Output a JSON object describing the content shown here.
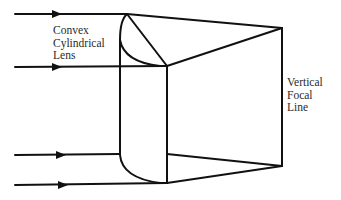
{
  "diagram": {
    "labels": {
      "lens": "Convex\nCylindrical\nLens",
      "focal_line": "Vertical\nFocal\nLine"
    },
    "colors": {
      "stroke": "#111111",
      "text": "#2a2a2a",
      "background": "#ffffff"
    },
    "incident_rays": [
      {
        "id": "ray-1",
        "y": 14
      },
      {
        "id": "ray-2",
        "y": 67
      },
      {
        "id": "ray-3",
        "y": 155
      },
      {
        "id": "ray-4",
        "y": 185
      }
    ],
    "focal_line": {
      "x": 282,
      "y_top": 28,
      "y_bottom": 166
    }
  }
}
